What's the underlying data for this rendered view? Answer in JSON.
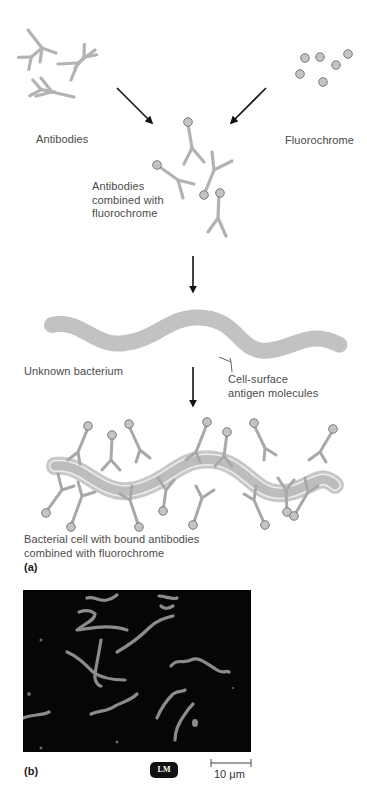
{
  "figure": {
    "panel_a": {
      "label": "(a)",
      "antibodies_label": "Antibodies",
      "fluorochrome_label": "Fluorochrome",
      "combined_label_line1": "Antibodies",
      "combined_label_line2": "combined with",
      "combined_label_line3": "fluorochrome",
      "bacterium_label": "Unknown bacterium",
      "antigen_label_line1": "Cell-surface",
      "antigen_label_line2": "antigen molecules",
      "bound_label_line1": "Bacterial cell with bound antibodies",
      "bound_label_line2": "combined with fluorochrome"
    },
    "panel_b": {
      "label": "(b)",
      "badge": "LM",
      "scale_bar": "10 μm"
    },
    "colors": {
      "antibody": "#b3b3b3",
      "fluorochrome_fill": "#c4c4c4",
      "fluorochrome_stroke": "#7a7a7a",
      "bacterium": "#c2c2c2",
      "micrograph_bg": "#060606",
      "micrograph_cells": "#8c8c8c",
      "arrow": "#111111"
    }
  }
}
